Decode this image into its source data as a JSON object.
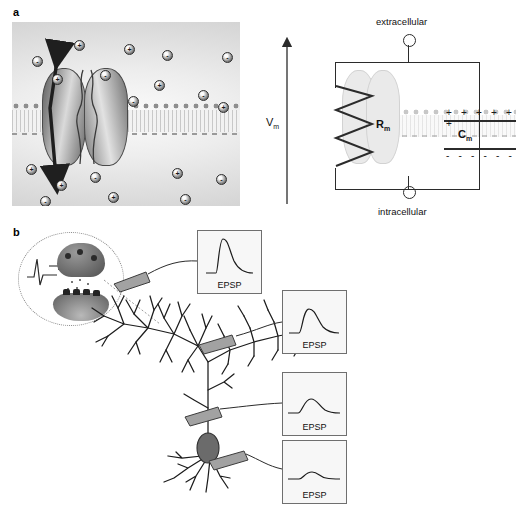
{
  "figure": {
    "panels": [
      {
        "id": "a",
        "label": "a"
      },
      {
        "id": "b",
        "label": "b"
      }
    ]
  },
  "panel_a": {
    "membrane_art": {
      "name": "ion-channel-in-lipid-bilayer",
      "channel_subunits": [
        "left-subunit",
        "right-subunit"
      ],
      "flux_arrow": "bidirectional-ion-flux-arrow",
      "ions": [
        {
          "charge": "+",
          "x": 62,
          "y": 18
        },
        {
          "charge": "+",
          "x": 112,
          "y": 22
        },
        {
          "charge": "-",
          "x": 20,
          "y": 34
        },
        {
          "charge": "-",
          "x": 150,
          "y": 28
        },
        {
          "charge": "-",
          "x": 210,
          "y": 30
        },
        {
          "charge": "-",
          "x": 88,
          "y": 48
        },
        {
          "charge": "+",
          "x": 40,
          "y": 52
        },
        {
          "charge": "+",
          "x": 142,
          "y": 58
        },
        {
          "charge": "-",
          "x": 186,
          "y": 68
        },
        {
          "charge": "-",
          "x": 116,
          "y": 74
        },
        {
          "charge": "+",
          "x": 206,
          "y": 80
        },
        {
          "charge": "+",
          "x": 14,
          "y": 142
        },
        {
          "charge": "+",
          "x": 160,
          "y": 146
        },
        {
          "charge": "-",
          "x": 78,
          "y": 150
        },
        {
          "charge": "-",
          "x": 204,
          "y": 152
        },
        {
          "charge": "+",
          "x": 44,
          "y": 158
        },
        {
          "charge": "+",
          "x": 96,
          "y": 170
        },
        {
          "charge": "-",
          "x": 28,
          "y": 174
        },
        {
          "charge": "-",
          "x": 168,
          "y": 172
        }
      ]
    },
    "circuit": {
      "top_terminal_label": "extracellular",
      "bottom_terminal_label": "intracellular",
      "voltage_label": "V",
      "voltage_subscript": "m",
      "resistor_label": "R",
      "resistor_subscript": "m",
      "capacitor_label": "C",
      "capacitor_subscript": "m",
      "outer_charges": "+ + + + + +",
      "inner_charges": "- - - - - -",
      "branches": [
        "resistive-branch-ion-channel",
        "capacitive-branch-membrane"
      ]
    }
  },
  "panel_b": {
    "inset": {
      "name": "synapse-inset",
      "elements": [
        "action-potential-trace",
        "presynaptic-terminal",
        "synaptic-vesicles",
        "neurotransmitter",
        "postsynaptic-receptors"
      ]
    },
    "neuron": {
      "name": "pyramidal-neuron",
      "parts": [
        "apical-dendritic-tuft",
        "apical-trunk",
        "soma",
        "basal-dendrites"
      ]
    },
    "epsp_boxes": [
      {
        "id": "epsp-distal-tuft",
        "caption": "EPSP",
        "amplitude": 1.0,
        "width": 0.45,
        "site": "distal-apical-tuft"
      },
      {
        "id": "epsp-mid-apical",
        "caption": "EPSP",
        "amplitude": 0.62,
        "width": 0.7,
        "site": "mid-apical-dendrite"
      },
      {
        "id": "epsp-proximal",
        "caption": "EPSP",
        "amplitude": 0.4,
        "width": 0.95,
        "site": "proximal-apical-dendrite"
      },
      {
        "id": "epsp-somatic",
        "caption": "EPSP",
        "amplitude": 0.18,
        "width": 1.25,
        "site": "soma"
      }
    ]
  },
  "chart_data": {
    "type": "line",
    "xlabel": "time",
    "ylabel": "membrane potential",
    "series": [
      {
        "name": "EPSP distal-apical-tuft",
        "peak_amplitude": 1.0,
        "half_width": 0.45
      },
      {
        "name": "EPSP mid-apical-dendrite",
        "peak_amplitude": 0.62,
        "half_width": 0.7
      },
      {
        "name": "EPSP proximal-apical-dendrite",
        "peak_amplitude": 0.4,
        "half_width": 0.95
      },
      {
        "name": "EPSP soma",
        "peak_amplitude": 0.18,
        "half_width": 1.25
      }
    ],
    "legend": [
      "EPSP",
      "EPSP",
      "EPSP",
      "EPSP"
    ],
    "grid": false
  },
  "colors": {
    "ink": "#2b2b2b",
    "membrane": "#d8d8d8",
    "bouton": "#9a9a9a",
    "soma": "#6b6b6b"
  }
}
